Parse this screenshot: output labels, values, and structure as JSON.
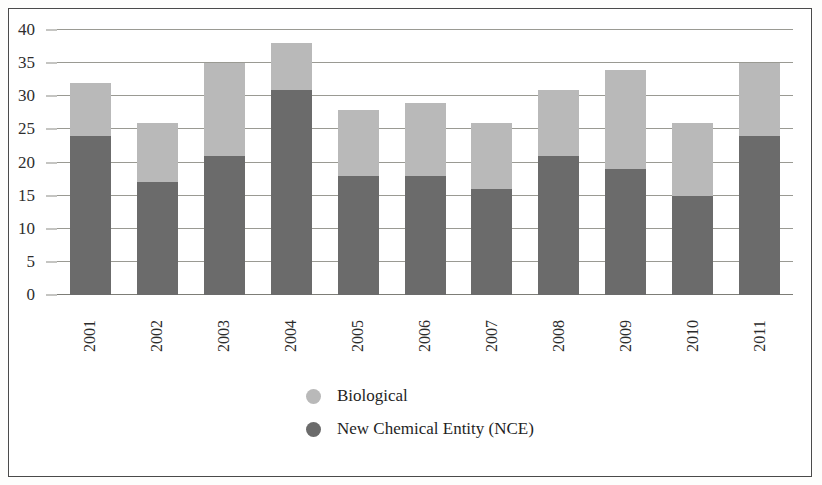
{
  "chart_data": {
    "type": "bar",
    "subtype": "stacked-vertical",
    "title": "",
    "xlabel": "",
    "ylabel": "",
    "ylim": [
      0,
      40
    ],
    "yticks": [
      0,
      5,
      10,
      15,
      20,
      25,
      30,
      35,
      40
    ],
    "grid": true,
    "legend_position": "bottom",
    "categories": [
      "2001",
      "2002",
      "2003",
      "2004",
      "2005",
      "2006",
      "2007",
      "2008",
      "2009",
      "2010",
      "2011"
    ],
    "series": [
      {
        "name": "New Chemical Entity (NCE)",
        "color": "#6b6b6b",
        "values": [
          24,
          17,
          21,
          31,
          18,
          18,
          16,
          21,
          19,
          15,
          24
        ]
      },
      {
        "name": "Biological",
        "color": "#b9b9b9",
        "values": [
          8,
          9,
          14,
          7,
          10,
          11,
          10,
          10,
          15,
          11,
          11
        ]
      }
    ],
    "totals": [
      32,
      26,
      35,
      38,
      28,
      29,
      26,
      31,
      34,
      26,
      35
    ]
  },
  "legend": {
    "items": [
      {
        "label": "Biological",
        "color": "#b9b9b9",
        "marker": "circle-icon"
      },
      {
        "label": "New Chemical Entity (NCE)",
        "color": "#6b6b6b",
        "marker": "circle-icon"
      }
    ]
  }
}
